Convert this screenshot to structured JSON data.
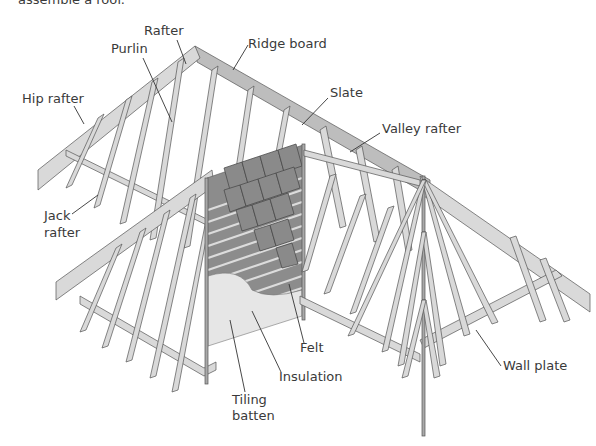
{
  "caption_fragment": "assemble a roof.",
  "diagram": {
    "labels": [
      {
        "id": "rafter",
        "text": "Rafter"
      },
      {
        "id": "purlin",
        "text": "Purlin"
      },
      {
        "id": "ridge-board",
        "text": "Ridge board"
      },
      {
        "id": "hip-rafter",
        "text": "Hip rafter"
      },
      {
        "id": "slate",
        "text": "Slate"
      },
      {
        "id": "valley-rafter",
        "text": "Valley rafter"
      },
      {
        "id": "jack-rafter-1",
        "text": "Jack"
      },
      {
        "id": "jack-rafter-2",
        "text": "rafter"
      },
      {
        "id": "felt",
        "text": "Felt"
      },
      {
        "id": "insulation",
        "text": "Insulation"
      },
      {
        "id": "tiling-batten-1",
        "text": "Tiling"
      },
      {
        "id": "tiling-batten-2",
        "text": "batten"
      },
      {
        "id": "wall-plate",
        "text": "Wall plate"
      }
    ]
  },
  "colors": {
    "background": "#ffffff",
    "timber": "#d9d9d9",
    "timber_shadow": "#a9a9a9",
    "slate": "#8a8a8a",
    "label_text": "#3a3a3a"
  }
}
